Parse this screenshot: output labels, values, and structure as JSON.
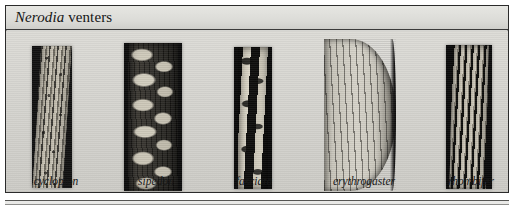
{
  "figure": {
    "title": {
      "genus": "Nerodia",
      "rest": " venters"
    },
    "frame_color": "#2b2b2b",
    "plate_background": "#d6d6d2",
    "title_bar_background": "#dcdcd8",
    "caption_text_color": "#171717"
  },
  "specimens": [
    {
      "label": "cyclopion",
      "center_x": 50,
      "description": "narrow tilted venter with coarse mottled dark speckling"
    },
    {
      "label": "sipedon",
      "center_x": 150,
      "description": "wide dark venter with bold irregular pale half-moon blotches"
    },
    {
      "label": "fasciata",
      "center_x": 248,
      "description": "narrow dark venter with large pale transverse cross-bars"
    },
    {
      "label": "erythrogaster",
      "center_x": 358,
      "description": "wide pale unmarked curved venter with fine dark scale seams"
    },
    {
      "label": "rhombifer",
      "center_x": 465,
      "description": "medium-width dark venter with regular pale rung-like bars"
    }
  ]
}
